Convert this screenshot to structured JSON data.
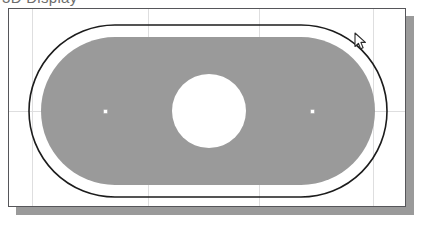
{
  "app": {
    "clipped_header_text": "3D Display",
    "canvas_background": "#ffffff",
    "canvas_border_color": "#56565a",
    "shadow_color": "#9a9a9a"
  },
  "canvas": {
    "label": "drawing-canvas",
    "width": 398,
    "height": 199,
    "grid": {
      "enabled": true,
      "line_color": "#dededf",
      "vertical_x": [
        23,
        139,
        250,
        364
      ],
      "horizontal_y": [
        102
      ]
    }
  },
  "drawing": {
    "name": "obround-profile-with-center-hole",
    "outline_color": "#1c1c1c",
    "outline_width": 1.6,
    "fill_color": "#9a9a9a",
    "hole_fill_color": "#ffffff",
    "shapes": [
      {
        "name": "outer-obround-outline",
        "type": "stadium",
        "x": 20,
        "y": 16,
        "width": 358,
        "height": 172,
        "radius": 86,
        "stroke": "#1c1c1c",
        "fill": "none"
      },
      {
        "name": "inner-offset-obround-fill",
        "type": "stadium",
        "x": 32,
        "y": 28,
        "width": 334,
        "height": 148,
        "radius": 74,
        "stroke": "none",
        "fill": "#9a9a9a"
      },
      {
        "name": "center-hole-circle",
        "type": "circle",
        "cx": 200,
        "cy": 102,
        "r": 37,
        "stroke": "none",
        "fill": "#ffffff"
      }
    ],
    "point_markers": [
      {
        "name": "point-marker-left",
        "x": 96,
        "y": 102
      },
      {
        "name": "point-marker-center",
        "x": 200,
        "y": 102
      },
      {
        "name": "point-marker-right",
        "x": 303,
        "y": 102
      }
    ]
  },
  "cursor": {
    "name": "arrow-pointer",
    "x": 354,
    "y": 32,
    "color": "#2b2b2b"
  }
}
